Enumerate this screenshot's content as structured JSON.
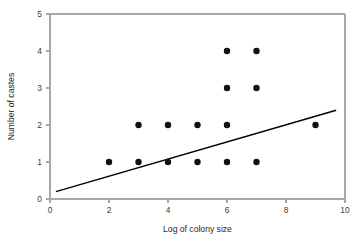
{
  "chart_data": {
    "type": "scatter",
    "title": "",
    "subtitle": "",
    "xlabel": "Log of colony size",
    "ylabel": "Number of castes",
    "xlim": [
      0,
      10
    ],
    "ylim": [
      0,
      5
    ],
    "xticks": [
      0,
      2,
      4,
      6,
      8,
      10
    ],
    "yticks": [
      0,
      1,
      2,
      3,
      4,
      5
    ],
    "xtick_labels": [
      "0",
      "2",
      "4",
      "6",
      "8",
      "10"
    ],
    "ytick_labels": [
      "0",
      "1",
      "2",
      "3",
      "4",
      "5"
    ],
    "grid": false,
    "legend": false,
    "legend_position": "none",
    "marker": "filled-circle",
    "marker_color": "#111111",
    "marker_radius": 3.2,
    "points": [
      {
        "x": 2,
        "y": 1
      },
      {
        "x": 3,
        "y": 1
      },
      {
        "x": 4,
        "y": 1
      },
      {
        "x": 5,
        "y": 1
      },
      {
        "x": 6,
        "y": 1
      },
      {
        "x": 7,
        "y": 1
      },
      {
        "x": 3,
        "y": 2
      },
      {
        "x": 4,
        "y": 2
      },
      {
        "x": 5,
        "y": 2
      },
      {
        "x": 6,
        "y": 2
      },
      {
        "x": 9,
        "y": 2
      },
      {
        "x": 6,
        "y": 3
      },
      {
        "x": 7,
        "y": 3
      },
      {
        "x": 6,
        "y": 4
      },
      {
        "x": 7,
        "y": 4
      }
    ],
    "series": [
      {
        "name": "colonies",
        "type": "scatter",
        "x": [
          2,
          3,
          4,
          5,
          6,
          7,
          3,
          4,
          5,
          6,
          9,
          6,
          7,
          6,
          7
        ],
        "values": [
          1,
          1,
          1,
          1,
          1,
          1,
          2,
          2,
          2,
          2,
          2,
          3,
          3,
          4,
          4
        ]
      },
      {
        "name": "regression-line",
        "type": "line",
        "color": "#000000",
        "x": [
          0.2,
          9.7
        ],
        "values": [
          0.2,
          2.4
        ]
      }
    ],
    "trend_line": {
      "x_start": 0.2,
      "y_start": 0.2,
      "x_end": 9.7,
      "y_end": 2.4,
      "color": "#000000"
    },
    "annotations": []
  },
  "axes": {
    "frame_color": "#a8a8a8",
    "tick_label_color": "#3a3a3a",
    "title_color": "#1f1f1f"
  }
}
